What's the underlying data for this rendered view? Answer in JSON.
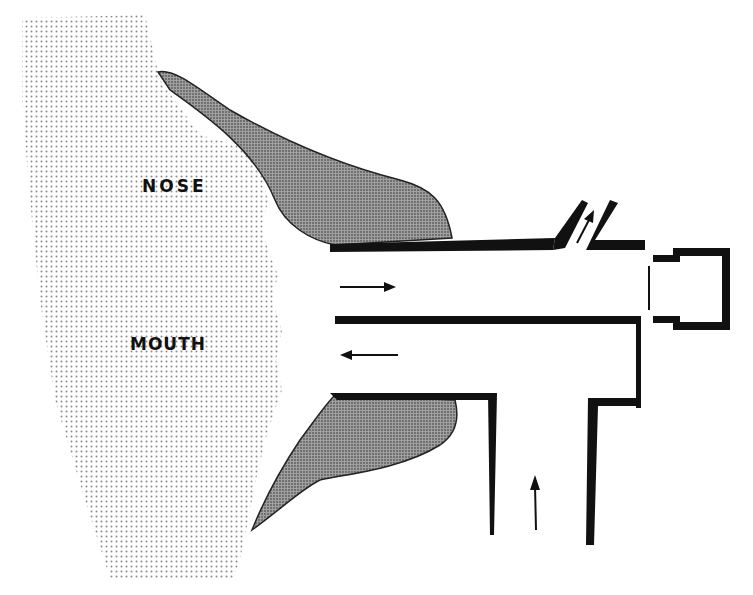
{
  "diagram": {
    "type": "schematic cross-section",
    "labels": {
      "nose": "NOSE",
      "mouth": "MOUTH"
    },
    "flow_arrows": [
      {
        "id": "inhale-arrow",
        "direction": "right",
        "location": "upper channel"
      },
      {
        "id": "exhale-arrow",
        "direction": "left",
        "location": "lower channel"
      },
      {
        "id": "outlet-arrow",
        "direction": "up-right",
        "location": "angled exhaust port"
      },
      {
        "id": "intake-arrow",
        "direction": "up",
        "location": "vertical intake tube"
      }
    ],
    "colors": {
      "ink": "#111111",
      "face_stipple": "#9a9a9a",
      "mask_shade": "#7a7a7a",
      "background": "#ffffff"
    }
  }
}
